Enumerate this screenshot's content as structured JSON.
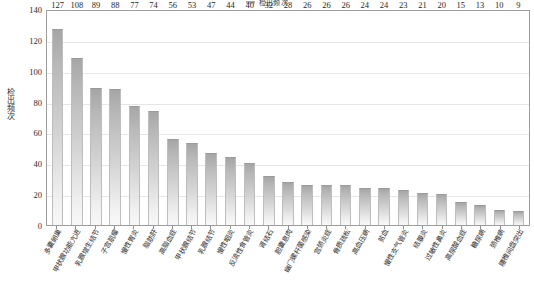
{
  "legend": {
    "label": "检出频次",
    "swatch_color": "#b0b0b0"
  },
  "axes": {
    "ylabel": "检出频次",
    "yticks": [
      "0",
      "20",
      "40",
      "60",
      "80",
      "100",
      "120",
      "140"
    ]
  },
  "colors": {
    "bar_top": "#a6a6a6",
    "bar_bottom": "#f8f8f8",
    "gridline": "#e6e6e6",
    "axis_border": "#9d9d9d",
    "text": "#2b2b2b"
  },
  "chart_data": {
    "type": "bar",
    "title": "",
    "xlabel": "",
    "ylabel": "检出频次",
    "ylim": [
      0,
      140
    ],
    "ytick_step": 20,
    "grid": true,
    "legend_position": "top-center",
    "categories": [
      "多囊卵巢",
      "甲状腺功能亢进",
      "乳腺增生结节",
      "子宫肌瘤",
      "慢性胃炎",
      "脂肪肝",
      "高脂血症",
      "甲状腺结节",
      "乳腺结节",
      "慢性咽炎",
      "反流性食管炎",
      "肾结石",
      "胆囊息肉",
      "幽门螺杆菌感染",
      "宫颈炎症",
      "骨质疏松",
      "高血压病",
      "贫血",
      "慢性支气管炎",
      "结膜炎",
      "过敏性鼻炎",
      "高尿酸血症",
      "糖尿病",
      "颈椎病",
      "腰椎间盘突出"
    ],
    "values": [
      127,
      108,
      89,
      88,
      77,
      74,
      56,
      53,
      47,
      44,
      40,
      32,
      28,
      26,
      26,
      26,
      24,
      24,
      23,
      21,
      20,
      15,
      13,
      10,
      9
    ],
    "series": [
      {
        "name": "检出频次",
        "values": [
          127,
          108,
          89,
          88,
          77,
          74,
          56,
          53,
          47,
          44,
          40,
          32,
          28,
          26,
          26,
          26,
          24,
          24,
          23,
          21,
          20,
          15,
          13,
          10,
          9
        ]
      }
    ]
  }
}
